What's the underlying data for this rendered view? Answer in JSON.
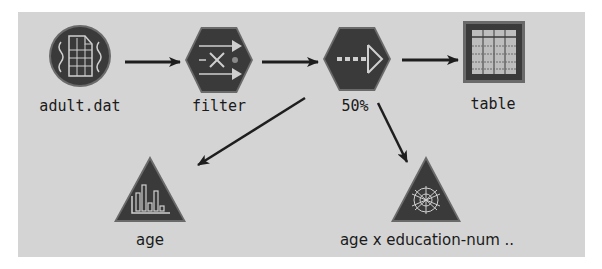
{
  "diagram": {
    "type": "stream-flow",
    "canvas_color": "#d4d4d4",
    "node_color": "#3c3c3c",
    "icon_line_color": "#cfcfcf",
    "nodes": [
      {
        "id": "adult",
        "label": "adult.dat",
        "shape": "circle",
        "icon": "data-file-icon"
      },
      {
        "id": "filter",
        "label": "filter",
        "shape": "hexagon",
        "icon": "filter-icon"
      },
      {
        "id": "sample",
        "label": "50%",
        "shape": "hexagon",
        "icon": "sample-arrow-icon"
      },
      {
        "id": "table",
        "label": "table",
        "shape": "square",
        "icon": "table-grid-icon"
      },
      {
        "id": "age",
        "label": "age",
        "shape": "triangle",
        "icon": "histogram-icon"
      },
      {
        "id": "web",
        "label": "age x education-num ..",
        "shape": "triangle",
        "icon": "web-graph-icon"
      }
    ],
    "edges": [
      {
        "from": "adult.dat",
        "to": "filter"
      },
      {
        "from": "filter",
        "to": "50%"
      },
      {
        "from": "50%",
        "to": "table"
      },
      {
        "from": "50%",
        "to": "age"
      },
      {
        "from": "50%",
        "to": "age x education-num .."
      }
    ]
  }
}
